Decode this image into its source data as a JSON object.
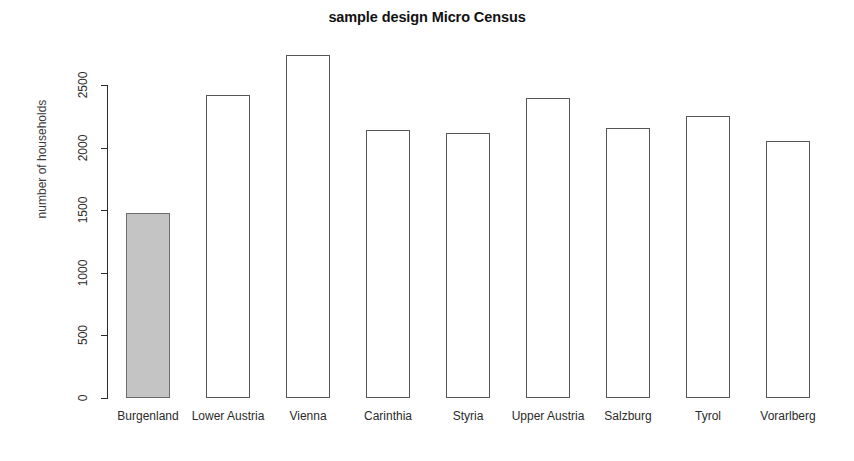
{
  "chart_data": {
    "type": "bar",
    "title": "sample design Micro Census",
    "xlabel": "",
    "ylabel": "number of households",
    "categories": [
      "Burgenland",
      "Lower Austria",
      "Vienna",
      "Carinthia",
      "Styria",
      "Upper Austria",
      "Salzburg",
      "Tyrol",
      "Vorarlberg"
    ],
    "values": [
      1480,
      2420,
      2740,
      2140,
      2120,
      2400,
      2160,
      2250,
      2050
    ],
    "ylim": [
      0,
      2800
    ],
    "yticks": [
      0,
      500,
      1000,
      1500,
      2000,
      2500
    ],
    "ytick_labels": [
      "0",
      "500",
      "1000",
      "1500",
      "2000",
      "2500"
    ],
    "grid": false,
    "legend": false,
    "highlighted_category": "Burgenland",
    "colors": {
      "highlight_fill": "#c4c4c4",
      "bar_fill": "#ffffff",
      "bar_border": "#555555",
      "axis": "#2b2b2b",
      "text": "#2b2b2b",
      "background": "#ffffff"
    }
  }
}
